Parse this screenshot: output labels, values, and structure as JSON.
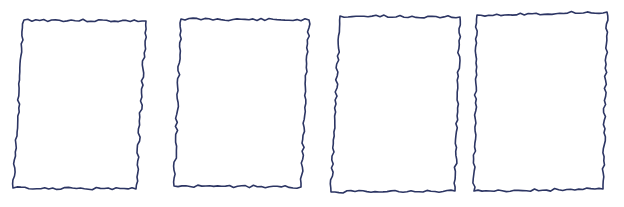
{
  "canvas": {
    "width": 624,
    "height": 207,
    "background": "#ffffff"
  },
  "style": {
    "ink_color": "#2c3563",
    "stroke_width": 1.6
  },
  "frames": [
    {
      "name": "frame-1",
      "corners": [
        [
          24,
          20
        ],
        [
          146,
          21
        ],
        [
          136,
          189
        ],
        [
          13,
          188
        ]
      ],
      "seed": 3
    },
    {
      "name": "frame-2",
      "corners": [
        [
          181,
          19
        ],
        [
          309,
          20
        ],
        [
          301,
          187
        ],
        [
          174,
          186
        ]
      ],
      "seed": 11
    },
    {
      "name": "frame-3",
      "corners": [
        [
          340,
          16
        ],
        [
          460,
          17
        ],
        [
          455,
          191
        ],
        [
          331,
          192
        ]
      ],
      "seed": 23
    },
    {
      "name": "frame-4",
      "corners": [
        [
          477,
          15
        ],
        [
          607,
          12
        ],
        [
          603,
          189
        ],
        [
          474,
          191
        ]
      ],
      "seed": 37
    }
  ]
}
